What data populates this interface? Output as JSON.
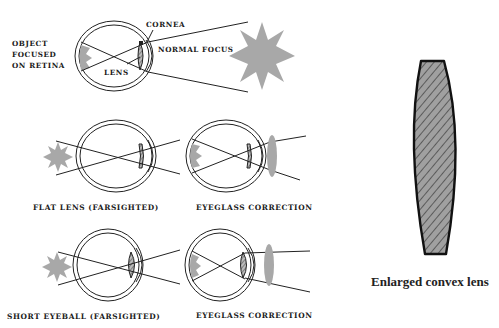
{
  "diagram": {
    "normal_panel": {
      "side_label_lines": [
        "OBJECT",
        "FOCUSED",
        "ON RETINA"
      ],
      "callout_cornea": "CORNEA",
      "callout_normal_focus": "NORMAL FOCUS",
      "callout_lens": "LENS"
    },
    "row1": {
      "left_caption": "FLAT LENS (FARSIGHTED)",
      "right_caption": "EYEGLASS CORRECTION"
    },
    "row2": {
      "left_caption": "SHORT EYEBALL (FARSIGHTED)",
      "right_caption": "EYEGLASS CORRECTION"
    },
    "enlarged_lens": {
      "caption": "Enlarged convex lens"
    },
    "colors": {
      "ink": "#222222",
      "object_gray": "#a8a8a8",
      "background": "#ffffff"
    }
  }
}
